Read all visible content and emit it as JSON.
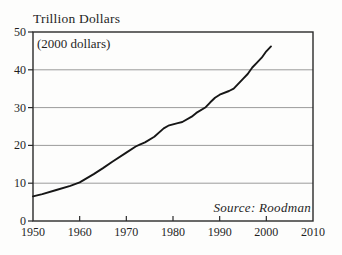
{
  "figure": {
    "title": "Trillion Dollars",
    "subtitle": "(2000 dollars)",
    "source": "Source: Roodman"
  },
  "colors": {
    "line": "#161616",
    "border": "#2a2a2a",
    "grid": "#9b9b9b",
    "text": "#1f1f1f",
    "background": "#fdfdfc"
  },
  "chart_data": {
    "type": "line",
    "title": "Trillion Dollars",
    "subtitle": "(2000 dollars)",
    "annotation": "Source: Roodman",
    "xlabel": "",
    "ylabel": "Trillion Dollars (2000 dollars)",
    "xlim": [
      1950,
      2010
    ],
    "ylim": [
      0,
      50
    ],
    "xticks": [
      1950,
      1960,
      1970,
      1980,
      1990,
      2000,
      2010
    ],
    "yticks": [
      0,
      10,
      20,
      30,
      40,
      50
    ],
    "grid": "horizontal-only",
    "legend": "none",
    "x": [
      1950,
      1952,
      1955,
      1958,
      1960,
      1963,
      1965,
      1967,
      1970,
      1972,
      1973,
      1974,
      1976,
      1978,
      1979,
      1981,
      1982,
      1984,
      1985,
      1987,
      1988,
      1989,
      1990,
      1992,
      1993,
      1995,
      1996,
      1997,
      1998,
      1999,
      2000,
      2001
    ],
    "values": [
      6.5,
      7.1,
      8.2,
      9.3,
      10.2,
      12.4,
      14.0,
      15.7,
      18.1,
      19.7,
      20.3,
      20.8,
      22.3,
      24.5,
      25.2,
      25.9,
      26.2,
      27.6,
      28.6,
      30.1,
      31.4,
      32.6,
      33.4,
      34.4,
      35.0,
      37.6,
      38.9,
      40.6,
      41.9,
      43.2,
      44.9,
      46.2
    ]
  }
}
